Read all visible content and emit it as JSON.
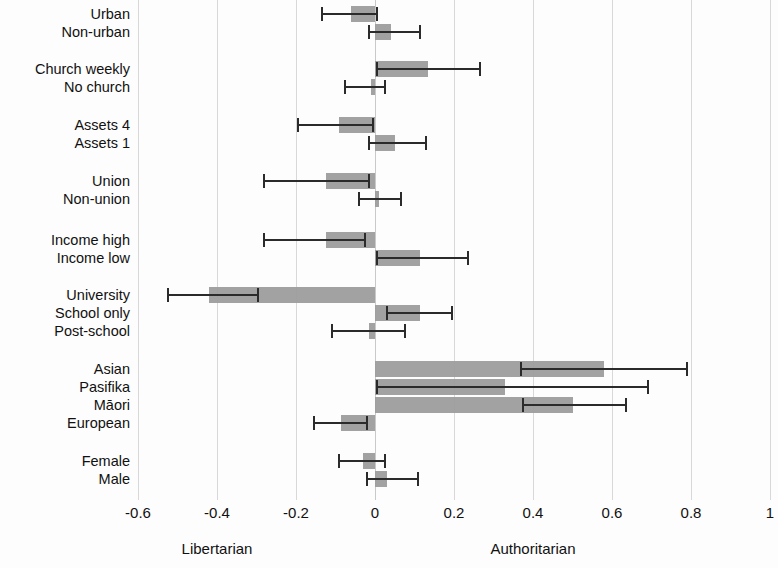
{
  "chart_data": {
    "type": "bar",
    "orientation": "horizontal",
    "title": "",
    "subtitle": "",
    "xlabel": "",
    "ylabel": "",
    "xlim": [
      -0.6,
      1.0
    ],
    "ylim": [],
    "grid": true,
    "legend_position": "none",
    "bar_color": "#9d9d9d",
    "whisker_color": "#2b2b2b",
    "zero_line": 0,
    "xticks": [
      -0.6,
      -0.4,
      -0.2,
      0,
      0.2,
      0.4,
      0.6,
      0.8,
      1
    ],
    "xticklabels": [
      "-0.6",
      "-0.4",
      "-0.2",
      "0",
      "0.2",
      "0.4",
      "0.6",
      "0.8",
      "1"
    ],
    "axis_captions": {
      "left": "Libertarian",
      "right": "Authoritarian",
      "left_at": -0.4,
      "right_at": 0.4
    },
    "categories": [
      "Urban",
      "Non-urban",
      "Church weekly",
      "No church",
      "Assets 4",
      "Assets 1",
      "Union",
      "Non-union",
      "Income high",
      "Income low",
      "University",
      "School only",
      "Post-school",
      "Asian",
      "Pasifika",
      "Māori",
      "European",
      "Female",
      "Male"
    ],
    "values": [
      -0.06,
      0.04,
      0.135,
      -0.01,
      -0.09,
      0.05,
      -0.125,
      0.01,
      -0.125,
      0.115,
      -0.42,
      0.115,
      -0.015,
      0.58,
      0.33,
      0.5,
      -0.085,
      -0.03,
      0.03
    ],
    "ci_low": [
      -0.135,
      -0.015,
      0.005,
      -0.075,
      -0.195,
      -0.015,
      -0.28,
      -0.04,
      -0.28,
      0.005,
      -0.525,
      0.03,
      -0.11,
      0.37,
      0.005,
      0.375,
      -0.155,
      -0.09,
      -0.02
    ],
    "ci_high": [
      0.005,
      0.115,
      0.265,
      0.025,
      -0.005,
      0.13,
      -0.015,
      0.065,
      -0.025,
      0.235,
      -0.295,
      0.195,
      0.075,
      0.79,
      0.69,
      0.635,
      -0.02,
      0.025,
      0.11
    ],
    "groups": [
      {
        "name": "Urbanisation",
        "items": [
          "Urban",
          "Non-urban"
        ]
      },
      {
        "name": "Religion",
        "items": [
          "Church weekly",
          "No church"
        ]
      },
      {
        "name": "Assets",
        "items": [
          "Assets 4",
          "Assets 1"
        ]
      },
      {
        "name": "Union membership",
        "items": [
          "Union",
          "Non-union"
        ]
      },
      {
        "name": "Income",
        "items": [
          "Income high",
          "Income low"
        ]
      },
      {
        "name": "Education",
        "items": [
          "University",
          "School only",
          "Post-school"
        ]
      },
      {
        "name": "Ethnicity",
        "items": [
          "Asian",
          "Pasifika",
          "Māori",
          "European"
        ]
      },
      {
        "name": "Sex",
        "items": [
          "Female",
          "Male"
        ]
      }
    ],
    "rows": [
      {
        "label": "Urban",
        "value": -0.06,
        "low": -0.135,
        "high": 0.005,
        "y": 14
      },
      {
        "label": "Non-urban",
        "value": 0.04,
        "low": -0.015,
        "high": 0.115,
        "y": 32
      },
      {
        "label": "Church weekly",
        "value": 0.135,
        "low": 0.005,
        "high": 0.265,
        "y": 69
      },
      {
        "label": "No church",
        "value": -0.01,
        "low": -0.075,
        "high": 0.025,
        "y": 87
      },
      {
        "label": "Assets 4",
        "value": -0.09,
        "low": -0.195,
        "high": -0.005,
        "y": 125
      },
      {
        "label": "Assets 1",
        "value": 0.05,
        "low": -0.015,
        "high": 0.13,
        "y": 143
      },
      {
        "label": "Union",
        "value": -0.125,
        "low": -0.28,
        "high": -0.015,
        "y": 181
      },
      {
        "label": "Non-union",
        "value": 0.01,
        "low": -0.04,
        "high": 0.065,
        "y": 199
      },
      {
        "label": "Income high",
        "value": -0.125,
        "low": -0.28,
        "high": -0.025,
        "y": 240
      },
      {
        "label": "Income low",
        "value": 0.115,
        "low": 0.005,
        "high": 0.235,
        "y": 258
      },
      {
        "label": "University",
        "value": -0.42,
        "low": -0.525,
        "high": -0.295,
        "y": 295
      },
      {
        "label": "School only",
        "value": 0.115,
        "low": 0.03,
        "high": 0.195,
        "y": 313
      },
      {
        "label": "Post-school",
        "value": -0.015,
        "low": -0.11,
        "high": 0.075,
        "y": 331
      },
      {
        "label": "Asian",
        "value": 0.58,
        "low": 0.37,
        "high": 0.79,
        "y": 369
      },
      {
        "label": "Pasifika",
        "value": 0.33,
        "low": 0.005,
        "high": 0.69,
        "y": 387
      },
      {
        "label": "Māori",
        "value": 0.5,
        "low": 0.375,
        "high": 0.635,
        "y": 405
      },
      {
        "label": "European",
        "value": -0.085,
        "low": -0.155,
        "high": -0.02,
        "y": 423
      },
      {
        "label": "Female",
        "value": -0.03,
        "low": -0.09,
        "high": 0.025,
        "y": 461
      },
      {
        "label": "Male",
        "value": 0.03,
        "low": -0.02,
        "high": 0.11,
        "y": 479
      }
    ]
  }
}
